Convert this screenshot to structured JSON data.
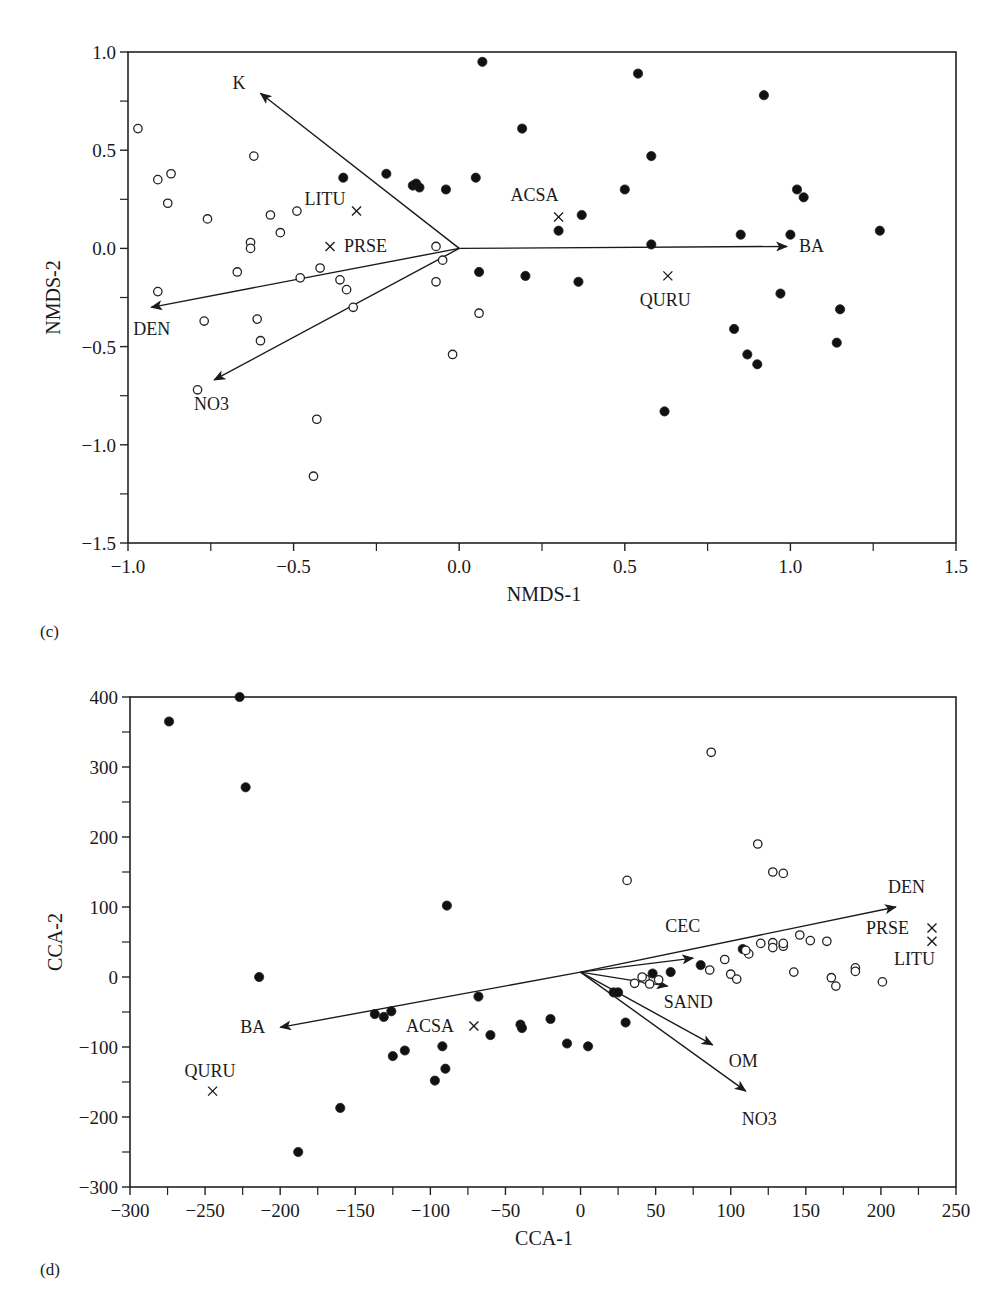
{
  "panels": [
    {
      "id": "c",
      "label": "(c)"
    },
    {
      "id": "d",
      "label": "(d)"
    }
  ],
  "chart_data": [
    {
      "type": "scatter",
      "panel": "(c)",
      "title": "",
      "xlabel": "NMDS-1",
      "ylabel": "NMDS-2",
      "xlim": [
        -1.0,
        1.5
      ],
      "ylim": [
        -1.5,
        1.0
      ],
      "xticks": [
        "-1.0",
        "-0.5",
        "0.0",
        "0.5",
        "1.0",
        "1.5"
      ],
      "yticks": [
        "-1.5",
        "-1.0",
        "-0.5",
        "0.0",
        "0.5",
        "1.0"
      ],
      "grid": false,
      "series": [
        {
          "name": "open",
          "marker": "open-circle",
          "points": [
            [
              -0.97,
              0.61
            ],
            [
              -0.91,
              0.35
            ],
            [
              -0.87,
              0.38
            ],
            [
              -0.88,
              0.23
            ],
            [
              -0.76,
              0.15
            ],
            [
              -0.62,
              0.47
            ],
            [
              -0.63,
              0.03
            ],
            [
              -0.63,
              0.0
            ],
            [
              -0.67,
              -0.12
            ],
            [
              -0.57,
              0.17
            ],
            [
              -0.54,
              0.08
            ],
            [
              -0.49,
              0.19
            ],
            [
              -0.48,
              -0.15
            ],
            [
              -0.91,
              -0.22
            ],
            [
              -0.77,
              -0.37
            ],
            [
              -0.61,
              -0.36
            ],
            [
              -0.6,
              -0.47
            ],
            [
              -0.79,
              -0.72
            ],
            [
              -0.42,
              -0.1
            ],
            [
              -0.36,
              -0.16
            ],
            [
              -0.34,
              -0.21
            ],
            [
              -0.32,
              -0.3
            ],
            [
              -0.07,
              0.01
            ],
            [
              -0.05,
              -0.06
            ],
            [
              -0.07,
              -0.17
            ],
            [
              0.06,
              -0.33
            ],
            [
              -0.02,
              -0.54
            ],
            [
              -0.43,
              -0.87
            ],
            [
              -0.44,
              -1.16
            ]
          ]
        },
        {
          "name": "filled",
          "marker": "filled-circle",
          "points": [
            [
              0.07,
              0.95
            ],
            [
              -0.35,
              0.36
            ],
            [
              -0.22,
              0.38
            ],
            [
              -0.14,
              0.32
            ],
            [
              -0.13,
              0.33
            ],
            [
              -0.12,
              0.31
            ],
            [
              -0.04,
              0.3
            ],
            [
              0.05,
              0.36
            ],
            [
              0.06,
              -0.12
            ],
            [
              0.19,
              0.61
            ],
            [
              0.2,
              -0.14
            ],
            [
              0.37,
              0.17
            ],
            [
              0.3,
              0.09
            ],
            [
              0.36,
              -0.17
            ],
            [
              0.54,
              0.89
            ],
            [
              0.58,
              0.47
            ],
            [
              0.5,
              0.3
            ],
            [
              0.58,
              0.02
            ],
            [
              0.62,
              -0.83
            ],
            [
              0.85,
              0.07
            ],
            [
              0.92,
              0.78
            ],
            [
              0.97,
              -0.23
            ],
            [
              1.0,
              0.07
            ],
            [
              1.02,
              0.3
            ],
            [
              1.04,
              0.26
            ],
            [
              0.83,
              -0.41
            ],
            [
              0.87,
              -0.54
            ],
            [
              0.9,
              -0.59
            ],
            [
              1.14,
              -0.48
            ],
            [
              1.15,
              -0.31
            ],
            [
              1.27,
              0.09
            ]
          ]
        },
        {
          "name": "species",
          "marker": "x",
          "points": [
            {
              "label": "LITU",
              "x": -0.31,
              "y": 0.19
            },
            {
              "label": "PRSE",
              "x": -0.39,
              "y": 0.01
            },
            {
              "label": "ACSA",
              "x": 0.3,
              "y": 0.16
            },
            {
              "label": "QURU",
              "x": 0.63,
              "y": -0.14
            }
          ]
        }
      ],
      "vectors": [
        {
          "label": "K",
          "x": -0.6,
          "y": 0.79
        },
        {
          "label": "BA",
          "x": 0.99,
          "y": 0.01
        },
        {
          "label": "DEN",
          "x": -0.93,
          "y": -0.3
        },
        {
          "label": "NO3",
          "x": -0.74,
          "y": -0.67
        }
      ]
    },
    {
      "type": "scatter",
      "panel": "(d)",
      "title": "",
      "xlabel": "CCA-1",
      "ylabel": "CCA-2",
      "xlim": [
        -300,
        250
      ],
      "ylim": [
        -300,
        400
      ],
      "xticks": [
        "-300",
        "-250",
        "-200",
        "-150",
        "-100",
        "-50",
        "0",
        "50",
        "100",
        "150",
        "200",
        "250"
      ],
      "yticks": [
        "-300",
        "-200",
        "-100",
        "0",
        "100",
        "200",
        "300",
        "400"
      ],
      "grid": false,
      "series": [
        {
          "name": "filled",
          "marker": "filled-circle",
          "points": [
            [
              -274,
              365
            ],
            [
              -227,
              400
            ],
            [
              -223,
              271
            ],
            [
              -214,
              0
            ],
            [
              -188,
              -250
            ],
            [
              -160,
              -187
            ],
            [
              -137,
              -53
            ],
            [
              -131,
              -57
            ],
            [
              -126,
              -49
            ],
            [
              -125,
              -113
            ],
            [
              -117,
              -105
            ],
            [
              -97,
              -148
            ],
            [
              -92,
              -99
            ],
            [
              -90,
              -131
            ],
            [
              -89,
              102
            ],
            [
              -68,
              -28
            ],
            [
              -60,
              -83
            ],
            [
              -40,
              -68
            ],
            [
              -39,
              -73
            ],
            [
              -20,
              -60
            ],
            [
              -9,
              -95
            ],
            [
              5,
              -99
            ],
            [
              22,
              -22
            ],
            [
              25,
              -22
            ],
            [
              30,
              -65
            ],
            [
              48,
              5
            ],
            [
              60,
              7
            ],
            [
              80,
              17
            ],
            [
              108,
              40
            ]
          ]
        },
        {
          "name": "open",
          "marker": "open-circle",
          "points": [
            [
              87,
              321
            ],
            [
              118,
              190
            ],
            [
              128,
              150
            ],
            [
              135,
              148
            ],
            [
              31,
              138
            ],
            [
              36,
              -9
            ],
            [
              43,
              -3
            ],
            [
              41,
              0
            ],
            [
              46,
              -10
            ],
            [
              52,
              -4
            ],
            [
              86,
              10
            ],
            [
              96,
              25
            ],
            [
              100,
              4
            ],
            [
              104,
              -3
            ],
            [
              112,
              33
            ],
            [
              120,
              48
            ],
            [
              128,
              49
            ],
            [
              128,
              42
            ],
            [
              135,
              44
            ],
            [
              135,
              48
            ],
            [
              110,
              38
            ],
            [
              142,
              7
            ],
            [
              146,
              60
            ],
            [
              153,
              52
            ],
            [
              164,
              51
            ],
            [
              167,
              -1
            ],
            [
              170,
              -13
            ],
            [
              183,
              13
            ],
            [
              183,
              8
            ],
            [
              201,
              -7
            ]
          ]
        },
        {
          "name": "species",
          "marker": "x",
          "points": [
            {
              "label": "PRSE",
              "x": 234,
              "y": 70
            },
            {
              "label": "LITU",
              "x": 234,
              "y": 51
            },
            {
              "label": "ACSA",
              "x": -71,
              "y": -70
            },
            {
              "label": "QURU",
              "x": -245,
              "y": -163
            }
          ]
        }
      ],
      "vectors": [
        {
          "label": "DEN",
          "x": 210,
          "y": 100
        },
        {
          "label": "CEC",
          "x": 75,
          "y": 27
        },
        {
          "label": "SAND",
          "x": 58,
          "y": -13
        },
        {
          "label": "OM",
          "x": 88,
          "y": -97
        },
        {
          "label": "NO3",
          "x": 110,
          "y": -163
        },
        {
          "label": "BA",
          "x": -200,
          "y": -72
        }
      ],
      "vector_origin": [
        0,
        7
      ]
    }
  ]
}
